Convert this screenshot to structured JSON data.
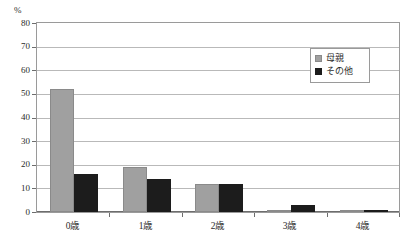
{
  "chart_data": {
    "type": "bar",
    "title": "",
    "xlabel": "",
    "ylabel": "%",
    "unit_label": "%",
    "categories": [
      "0歳",
      "1歳",
      "2歳",
      "3歳",
      "4歳"
    ],
    "series": [
      {
        "name": "母親",
        "color": "#a0a0a0",
        "values": [
          52,
          19,
          12,
          1,
          0.3
        ]
      },
      {
        "name": "その他",
        "color": "#1c1c1c",
        "values": [
          16,
          14,
          12,
          3,
          0.3
        ]
      }
    ],
    "ylim": [
      0,
      80
    ],
    "ytick_values": [
      0,
      10,
      20,
      30,
      40,
      50,
      60,
      70,
      80
    ],
    "ytick_labels": [
      "0",
      "10",
      "20",
      "30",
      "40",
      "50",
      "60",
      "70",
      "80"
    ],
    "grid": {
      "horizontal": true,
      "vertical": false
    },
    "legend": {
      "position": "top-right",
      "entries": [
        {
          "label": "母親",
          "swatch": "gray"
        },
        {
          "label": "その他",
          "swatch": "black"
        }
      ]
    },
    "plot_border_color": "#9a9a9a",
    "gridline_color": "#b9b9b9"
  }
}
